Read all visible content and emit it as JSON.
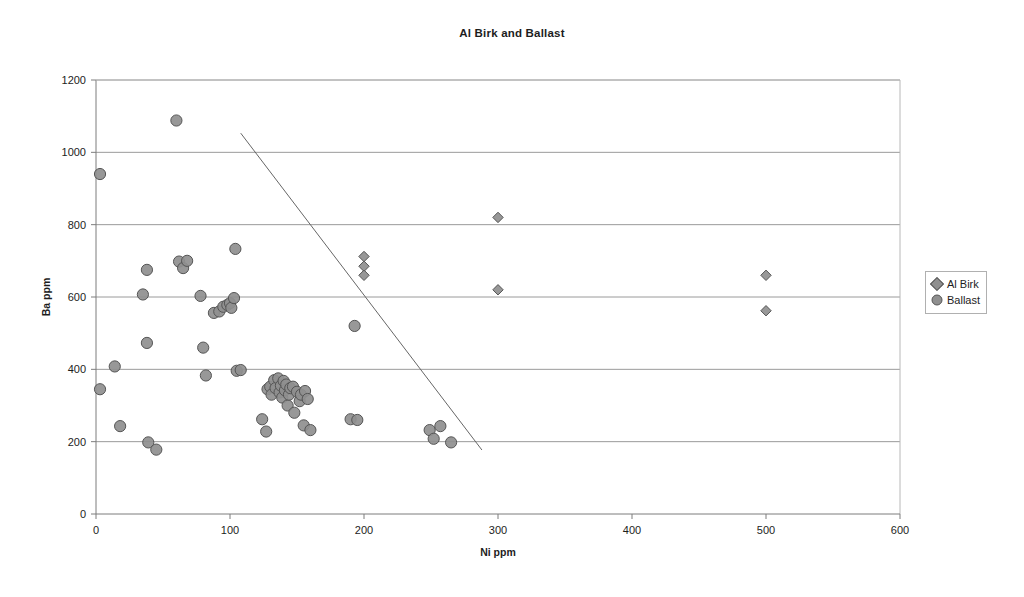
{
  "chart_data": {
    "type": "scatter",
    "title": "Al Birk and Ballast",
    "xlabel": "Ni ppm",
    "ylabel": "Ba ppm",
    "xlim": [
      0,
      600
    ],
    "ylim": [
      0,
      1200
    ],
    "xticks": [
      0,
      100,
      200,
      300,
      400,
      500,
      600
    ],
    "yticks": [
      0,
      200,
      400,
      600,
      800,
      1000,
      1200
    ],
    "grid": "horizontal",
    "legend_position": "right",
    "series": [
      {
        "name": "Al Birk",
        "marker": "diamond",
        "color": "#8f8f8f",
        "edge_color": "#555555",
        "points": [
          [
            200,
            712
          ],
          [
            200,
            685
          ],
          [
            200,
            660
          ],
          [
            300,
            820
          ],
          [
            300,
            620
          ],
          [
            500,
            660
          ],
          [
            500,
            562
          ]
        ]
      },
      {
        "name": "Ballast",
        "marker": "circle",
        "color": "#8f8f8f",
        "edge_color": "#555555",
        "points": [
          [
            3,
            940
          ],
          [
            3,
            345
          ],
          [
            14,
            408
          ],
          [
            18,
            243
          ],
          [
            35,
            607
          ],
          [
            38,
            675
          ],
          [
            38,
            473
          ],
          [
            39,
            198
          ],
          [
            45,
            178
          ],
          [
            60,
            1088
          ],
          [
            62,
            698
          ],
          [
            65,
            680
          ],
          [
            68,
            700
          ],
          [
            78,
            603
          ],
          [
            80,
            460
          ],
          [
            82,
            383
          ],
          [
            88,
            556
          ],
          [
            92,
            560
          ],
          [
            95,
            573
          ],
          [
            98,
            578
          ],
          [
            100,
            583
          ],
          [
            101,
            570
          ],
          [
            103,
            597
          ],
          [
            104,
            733
          ],
          [
            105,
            396
          ],
          [
            108,
            398
          ],
          [
            124,
            262
          ],
          [
            127,
            228
          ],
          [
            128,
            345
          ],
          [
            130,
            352
          ],
          [
            131,
            330
          ],
          [
            133,
            370
          ],
          [
            134,
            348
          ],
          [
            136,
            375
          ],
          [
            137,
            336
          ],
          [
            138,
            355
          ],
          [
            139,
            322
          ],
          [
            140,
            368
          ],
          [
            141,
            342
          ],
          [
            142,
            358
          ],
          [
            143,
            300
          ],
          [
            144,
            330
          ],
          [
            145,
            348
          ],
          [
            147,
            352
          ],
          [
            148,
            280
          ],
          [
            150,
            338
          ],
          [
            152,
            312
          ],
          [
            153,
            330
          ],
          [
            155,
            245
          ],
          [
            156,
            340
          ],
          [
            158,
            318
          ],
          [
            160,
            232
          ],
          [
            190,
            262
          ],
          [
            195,
            260
          ],
          [
            193,
            520
          ],
          [
            249,
            232
          ],
          [
            252,
            208
          ],
          [
            257,
            243
          ],
          [
            265,
            198
          ]
        ]
      }
    ],
    "annotations": [
      {
        "type": "line",
        "name": "boundary-line",
        "x1": 108,
        "y1": 1053,
        "x2": 288,
        "y2": 177,
        "color": "#666666"
      }
    ]
  },
  "legend": {
    "items": [
      {
        "label": "Al Birk",
        "marker": "diamond"
      },
      {
        "label": "Ballast",
        "marker": "circle"
      }
    ]
  }
}
